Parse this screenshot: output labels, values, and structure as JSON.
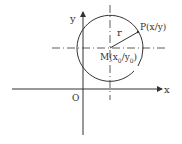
{
  "diagram": {
    "labels": {
      "y_axis": "y",
      "x_axis": "x",
      "origin": "O",
      "radius": "r",
      "point": "P(x/y)",
      "center_prefix": "M(x",
      "center_sub0": "0",
      "center_mid": "/y",
      "center_sub1": "0",
      "center_suffix": ")"
    },
    "colors": {
      "stroke": "#333333",
      "background": "#ffffff"
    }
  }
}
